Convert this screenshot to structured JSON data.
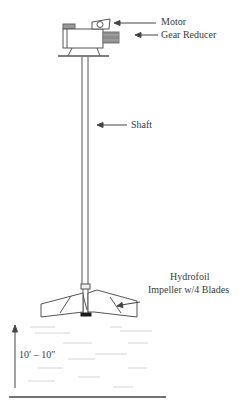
{
  "diagram": {
    "type": "mixer-schematic",
    "labels": {
      "motor": "Motor",
      "gear_reducer": "Gear Reducer",
      "shaft": "Shaft",
      "impeller_line1": "Hydrofoil",
      "impeller_line2": "Impeller w/4 Blades",
      "liquid_depth": "10′ – 10″"
    },
    "components": [
      "motor",
      "gear-reducer",
      "mounting-base",
      "shaft",
      "hydrofoil-impeller",
      "liquid-level",
      "tank-floor"
    ],
    "colors": {
      "line": "#555555",
      "gear_fill": "#8c8c8c",
      "hub_fill": "#1a1a1a",
      "water_lines": "#cfcfcf"
    }
  }
}
